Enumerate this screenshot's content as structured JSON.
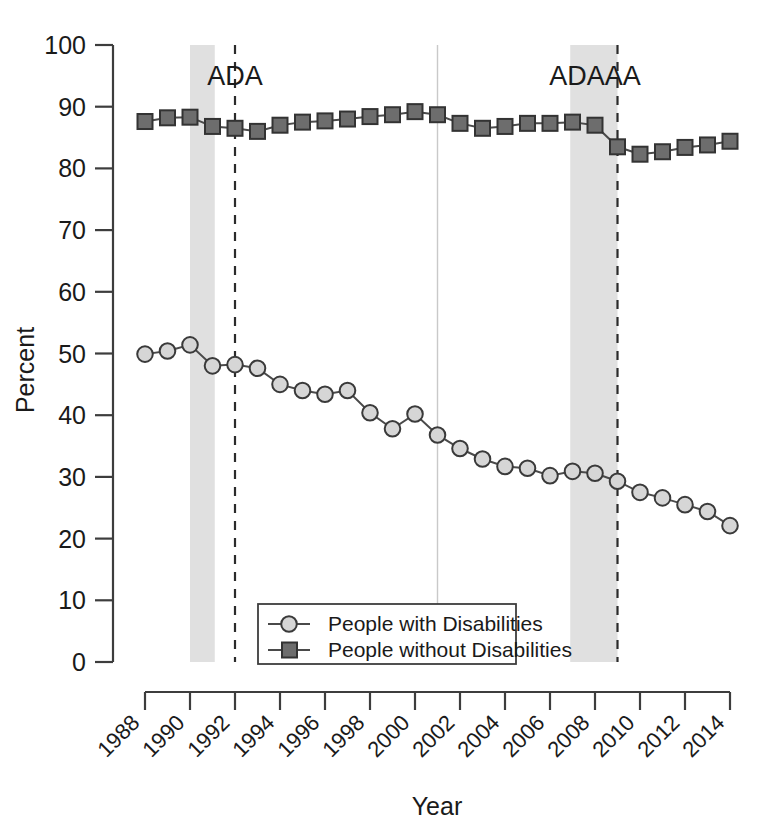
{
  "chart_data": {
    "type": "line",
    "title": "",
    "xlabel": "Year",
    "ylabel": "Percent",
    "ylim": [
      0,
      100
    ],
    "xlim": [
      1988,
      2014
    ],
    "ytick_labels": [
      "0",
      "10",
      "20",
      "30",
      "40",
      "50",
      "60",
      "70",
      "80",
      "90",
      "100"
    ],
    "ytick_values": [
      0,
      10,
      20,
      30,
      40,
      50,
      60,
      70,
      80,
      90,
      100
    ],
    "xtick_labels": [
      "1988",
      "1990",
      "1992",
      "1994",
      "1996",
      "1998",
      "2000",
      "2002",
      "2004",
      "2006",
      "2008",
      "2010",
      "2012",
      "2014"
    ],
    "xtick_values": [
      1988,
      1990,
      1992,
      1994,
      1996,
      1998,
      2000,
      2002,
      2004,
      2006,
      2008,
      2010,
      2012,
      2014
    ],
    "grid": false,
    "legend_position": "bottom-center",
    "x": [
      1988,
      1989,
      1990,
      1991,
      1992,
      1993,
      1994,
      1995,
      1996,
      1997,
      1998,
      1999,
      2000,
      2001,
      2002,
      2003,
      2004,
      2005,
      2006,
      2007,
      2008,
      2009,
      2010,
      2011,
      2012,
      2013,
      2014
    ],
    "series": [
      {
        "name": "People with Disabilities",
        "marker": "circle",
        "marker_fill": "#d6d6d6",
        "line_color": "#4a4a4a",
        "values": [
          49.9,
          50.4,
          51.4,
          48.0,
          48.2,
          47.6,
          45.0,
          44.0,
          43.4,
          44.0,
          40.4,
          37.8,
          40.2,
          36.8,
          34.6,
          32.9,
          31.7,
          31.4,
          30.2,
          30.9,
          30.6,
          29.3,
          27.5,
          26.6,
          25.5,
          24.4,
          22.1
        ],
        "legend_label": "People with Disabilities"
      },
      {
        "name": "People without Disabilities",
        "marker": "square",
        "marker_fill": "#6d6d6d",
        "line_color": "#4a4a4a",
        "values": [
          87.6,
          88.2,
          88.3,
          86.8,
          86.5,
          86.0,
          87.0,
          87.5,
          87.7,
          88.0,
          88.4,
          88.7,
          89.2,
          88.7,
          87.3,
          86.5,
          86.8,
          87.3,
          87.3,
          87.5,
          87.0,
          83.5,
          82.3,
          82.7,
          83.4,
          83.8,
          84.4
        ],
        "legend_label": "People without Disabilities"
      }
    ],
    "annotations": [
      {
        "label": "ADA",
        "x": 1992,
        "y": 95,
        "line_x": 1992,
        "line_style": "dashed"
      },
      {
        "label": "ADAAA",
        "x": 2008,
        "y": 95,
        "line_x": 2009,
        "line_style": "dashed"
      }
    ],
    "shaded_regions": [
      {
        "name": "recession-1990",
        "x_start": 1990.0,
        "x_end": 1991.1,
        "color": "#e0e0e0"
      },
      {
        "name": "recession-2008",
        "x_start": 2006.9,
        "x_end": 2009.0,
        "color": "#e0e0e0"
      }
    ],
    "reference_lines": [
      {
        "name": "marker-2001",
        "x": 2001.0,
        "color": "#c9c9c9"
      }
    ]
  },
  "colors": {
    "axis": "#3d3d3d",
    "shade": "#e0e0e0",
    "circle_fill": "#d6d6d6",
    "square_fill": "#6d6d6d",
    "line": "#4a4a4a",
    "background": "#ffffff"
  }
}
